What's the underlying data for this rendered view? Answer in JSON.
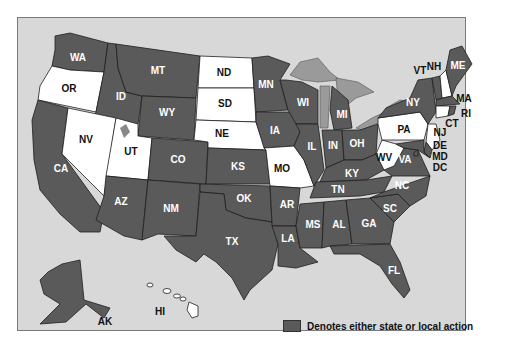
{
  "colors": {
    "action": "#5a5a5a",
    "no_action": "#ffffff",
    "water": "#d8d8d8",
    "lakes": "#9a9a9a"
  },
  "legend": {
    "label": "Denotes either state or local action"
  },
  "states": {
    "WA": {
      "label": "WA",
      "action": true
    },
    "OR": {
      "label": "OR",
      "action": false
    },
    "CA": {
      "label": "CA",
      "action": true
    },
    "ID": {
      "label": "ID",
      "action": true
    },
    "NV": {
      "label": "NV",
      "action": false
    },
    "MT": {
      "label": "MT",
      "action": true
    },
    "WY": {
      "label": "WY",
      "action": true
    },
    "UT": {
      "label": "UT",
      "action": false
    },
    "AZ": {
      "label": "AZ",
      "action": true
    },
    "CO": {
      "label": "CO",
      "action": true
    },
    "NM": {
      "label": "NM",
      "action": true
    },
    "ND": {
      "label": "ND",
      "action": false
    },
    "SD": {
      "label": "SD",
      "action": false
    },
    "NE": {
      "label": "NE",
      "action": false
    },
    "KS": {
      "label": "KS",
      "action": true
    },
    "OK": {
      "label": "OK",
      "action": true
    },
    "TX": {
      "label": "TX",
      "action": true
    },
    "MN": {
      "label": "MN",
      "action": true
    },
    "IA": {
      "label": "IA",
      "action": true
    },
    "MO": {
      "label": "MO",
      "action": false
    },
    "AR": {
      "label": "AR",
      "action": true
    },
    "LA": {
      "label": "LA",
      "action": true
    },
    "WI": {
      "label": "WI",
      "action": true
    },
    "IL": {
      "label": "IL",
      "action": true
    },
    "MI": {
      "label": "MI",
      "action": true
    },
    "IN": {
      "label": "IN",
      "action": true
    },
    "OH": {
      "label": "OH",
      "action": true
    },
    "KY": {
      "label": "KY",
      "action": true
    },
    "TN": {
      "label": "TN",
      "action": true
    },
    "MS": {
      "label": "MS",
      "action": true
    },
    "AL": {
      "label": "AL",
      "action": true
    },
    "GA": {
      "label": "GA",
      "action": true
    },
    "FL": {
      "label": "FL",
      "action": true
    },
    "SC": {
      "label": "SC",
      "action": true
    },
    "NC": {
      "label": "NC",
      "action": true
    },
    "VA": {
      "label": "VA",
      "action": true
    },
    "WV": {
      "label": "WV",
      "action": false
    },
    "PA": {
      "label": "PA",
      "action": false
    },
    "NY": {
      "label": "NY",
      "action": true
    },
    "VT": {
      "label": "VT",
      "action": true
    },
    "NH": {
      "label": "NH",
      "action": false
    },
    "ME": {
      "label": "ME",
      "action": true
    },
    "MA": {
      "label": "MA",
      "action": true
    },
    "RI": {
      "label": "RI",
      "action": true
    },
    "CT": {
      "label": "CT",
      "action": false
    },
    "NJ": {
      "label": "NJ",
      "action": false
    },
    "DE": {
      "label": "DE",
      "action": true
    },
    "MD": {
      "label": "MD",
      "action": true
    },
    "DC": {
      "label": "DC",
      "action": true
    },
    "AK": {
      "label": "AK",
      "action": true
    },
    "HI": {
      "label": "HI",
      "action": false
    }
  }
}
